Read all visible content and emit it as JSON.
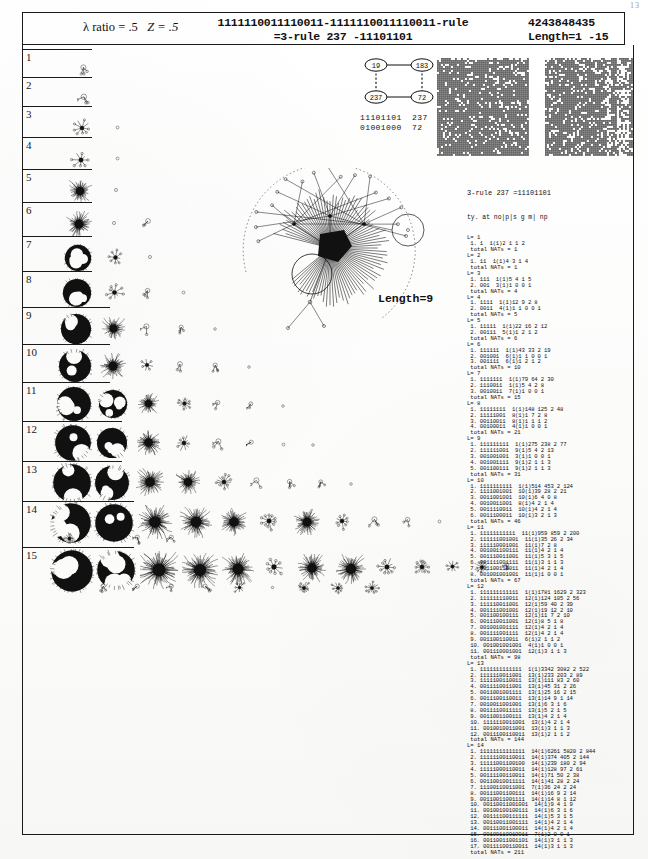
{
  "page": {
    "page_number": "13",
    "paper_tone": "#fbfbfa",
    "ink_color": "#111111"
  },
  "header": {
    "lambda_ratio_label": "λ ratio = .5",
    "z_label": "Z = .5",
    "rule_line_1": "1111110011110011-1111110011110011-rule",
    "rule_line_2": "=3-rule 237 -11101101",
    "rule_number": "4243848435",
    "length_range": "Length=1 -15"
  },
  "node_graph": {
    "nodes": [
      {
        "id": "n-top-left",
        "label": "19",
        "cx": 20,
        "cy": 10
      },
      {
        "id": "n-top-right",
        "label": "183",
        "cx": 66,
        "cy": 10
      },
      {
        "id": "n-bottom-left",
        "label": "237",
        "cx": 20,
        "cy": 42
      },
      {
        "id": "n-bottom-right",
        "label": "72",
        "cx": 66,
        "cy": 42
      }
    ],
    "edges": [
      {
        "from": "n-top-left",
        "to": "n-top-right",
        "style": "solid"
      },
      {
        "from": "n-bottom-left",
        "to": "n-bottom-right",
        "style": "solid"
      },
      {
        "from": "n-top-left",
        "to": "n-bottom-left",
        "style": "dashed"
      },
      {
        "from": "n-top-right",
        "to": "n-bottom-right",
        "style": "dashed"
      }
    ],
    "binary_rows": [
      {
        "bits": "11101101",
        "decimal": "237"
      },
      {
        "bits": "01001000",
        "decimal": "72"
      }
    ]
  },
  "space_time_diagrams": [
    {
      "name": "spacetime-left",
      "x": 437,
      "width": 92,
      "height": 98,
      "cols": 46,
      "rows": 49,
      "seed": 1734,
      "density": 0.86,
      "streak_cols": []
    },
    {
      "name": "spacetime-right",
      "x": 545,
      "width": 88,
      "height": 98,
      "cols": 44,
      "rows": 49,
      "seed": 9021,
      "density": 0.82,
      "streak_cols": [
        31,
        32,
        36,
        37,
        38,
        39,
        40,
        41
      ]
    }
  ],
  "big_basin": {
    "length_label": "Length=9",
    "attractor_cycle_nodes": 9,
    "fan_spokes": 86,
    "outer_tree_nodes": 17
  },
  "rows": [
    {
      "number": "1",
      "top": 49,
      "height": 28,
      "glyphs": [
        {
          "x": 55,
          "y": 12,
          "size": 16,
          "kind": "sprout"
        }
      ]
    },
    {
      "number": "2",
      "top": 77,
      "height": 29,
      "glyphs": [
        {
          "x": 55,
          "y": 13,
          "size": 17,
          "kind": "sprout"
        }
      ]
    },
    {
      "number": "3",
      "top": 106,
      "height": 31,
      "glyphs": [
        {
          "x": 50,
          "y": 12,
          "size": 20,
          "kind": "star"
        },
        {
          "x": 90,
          "y": 16,
          "size": 11,
          "kind": "dot"
        }
      ]
    },
    {
      "number": "4",
      "top": 137,
      "height": 32,
      "glyphs": [
        {
          "x": 48,
          "y": 12,
          "size": 22,
          "kind": "star"
        },
        {
          "x": 90,
          "y": 16,
          "size": 11,
          "kind": "dot"
        }
      ]
    },
    {
      "number": "5",
      "top": 169,
      "height": 33,
      "glyphs": [
        {
          "x": 46,
          "y": 10,
          "size": 24,
          "kind": "bush"
        },
        {
          "x": 88,
          "y": 15,
          "size": 12,
          "kind": "dot"
        }
      ]
    },
    {
      "number": "6",
      "top": 202,
      "height": 34,
      "glyphs": [
        {
          "x": 44,
          "y": 9,
          "size": 26,
          "kind": "bush"
        },
        {
          "x": 86,
          "y": 15,
          "size": 12,
          "kind": "dot"
        },
        {
          "x": 120,
          "y": 13,
          "size": 15,
          "kind": "sprout"
        }
      ]
    },
    {
      "number": "7",
      "top": 236,
      "height": 35,
      "glyphs": [
        {
          "x": 42,
          "y": 8,
          "size": 28,
          "kind": "blob"
        },
        {
          "x": 84,
          "y": 12,
          "size": 19,
          "kind": "star"
        },
        {
          "x": 122,
          "y": 15,
          "size": 12,
          "kind": "dot"
        }
      ]
    },
    {
      "number": "8",
      "top": 271,
      "height": 36,
      "glyphs": [
        {
          "x": 40,
          "y": 7,
          "size": 30,
          "kind": "blob"
        },
        {
          "x": 82,
          "y": 11,
          "size": 21,
          "kind": "star"
        },
        {
          "x": 120,
          "y": 14,
          "size": 14,
          "kind": "sprout"
        },
        {
          "x": 156,
          "y": 16,
          "size": 11,
          "kind": "dot"
        }
      ]
    },
    {
      "number": "9",
      "top": 307,
      "height": 37,
      "glyphs": [
        {
          "x": 38,
          "y": 6,
          "size": 32,
          "kind": "blob"
        },
        {
          "x": 80,
          "y": 10,
          "size": 23,
          "kind": "bush"
        },
        {
          "x": 118,
          "y": 13,
          "size": 16,
          "kind": "sprout"
        },
        {
          "x": 154,
          "y": 15,
          "size": 13,
          "kind": "sprout"
        },
        {
          "x": 188,
          "y": 17,
          "size": 10,
          "kind": "dot"
        }
      ]
    },
    {
      "number": "10",
      "top": 344,
      "height": 38,
      "glyphs": [
        {
          "x": 36,
          "y": 5,
          "size": 34,
          "kind": "blob"
        },
        {
          "x": 78,
          "y": 9,
          "size": 26,
          "kind": "bush"
        },
        {
          "x": 116,
          "y": 12,
          "size": 18,
          "kind": "star"
        },
        {
          "x": 152,
          "y": 14,
          "size": 15,
          "kind": "sprout"
        },
        {
          "x": 188,
          "y": 16,
          "size": 13,
          "kind": "sprout"
        },
        {
          "x": 222,
          "y": 18,
          "size": 10,
          "kind": "dot"
        }
      ]
    },
    {
      "number": "11",
      "top": 382,
      "height": 39,
      "glyphs": [
        {
          "x": 34,
          "y": 4,
          "size": 36,
          "kind": "blob"
        },
        {
          "x": 76,
          "y": 7,
          "size": 30,
          "kind": "blob"
        },
        {
          "x": 116,
          "y": 11,
          "size": 21,
          "kind": "bush"
        },
        {
          "x": 154,
          "y": 13,
          "size": 17,
          "kind": "star"
        },
        {
          "x": 190,
          "y": 15,
          "size": 14,
          "kind": "sprout"
        },
        {
          "x": 224,
          "y": 17,
          "size": 12,
          "kind": "sprout"
        },
        {
          "x": 256,
          "y": 19,
          "size": 10,
          "kind": "dot"
        }
      ]
    },
    {
      "number": "12",
      "top": 421,
      "height": 40,
      "glyphs": [
        {
          "x": 32,
          "y": 3,
          "size": 38,
          "kind": "blob"
        },
        {
          "x": 74,
          "y": 6,
          "size": 32,
          "kind": "blob"
        },
        {
          "x": 114,
          "y": 9,
          "size": 25,
          "kind": "bush"
        },
        {
          "x": 152,
          "y": 12,
          "size": 20,
          "kind": "star"
        },
        {
          "x": 190,
          "y": 14,
          "size": 16,
          "kind": "sprout"
        },
        {
          "x": 224,
          "y": 16,
          "size": 13,
          "kind": "sprout"
        },
        {
          "x": 256,
          "y": 18,
          "size": 11,
          "kind": "dot"
        },
        {
          "x": 286,
          "y": 19,
          "size": 10,
          "kind": "dot"
        }
      ]
    },
    {
      "number": "13",
      "top": 461,
      "height": 40,
      "glyphs": [
        {
          "x": 30,
          "y": 2,
          "size": 40,
          "kind": "blob"
        },
        {
          "x": 72,
          "y": 4,
          "size": 36,
          "kind": "blob"
        },
        {
          "x": 114,
          "y": 7,
          "size": 28,
          "kind": "bush"
        },
        {
          "x": 154,
          "y": 9,
          "size": 24,
          "kind": "bush"
        },
        {
          "x": 192,
          "y": 11,
          "size": 20,
          "kind": "star"
        },
        {
          "x": 228,
          "y": 13,
          "size": 16,
          "kind": "sprout"
        },
        {
          "x": 262,
          "y": 15,
          "size": 14,
          "kind": "sprout"
        },
        {
          "x": 294,
          "y": 16,
          "size": 12,
          "kind": "sprout"
        },
        {
          "x": 324,
          "y": 18,
          "size": 10,
          "kind": "dot"
        }
      ]
    },
    {
      "number": "14",
      "top": 501,
      "height": 46,
      "glyphs": [
        {
          "x": 28,
          "y": 1,
          "size": 42,
          "kind": "blob"
        },
        {
          "x": 72,
          "y": 2,
          "size": 40,
          "kind": "blob"
        },
        {
          "x": 116,
          "y": 4,
          "size": 34,
          "kind": "bush"
        },
        {
          "x": 158,
          "y": 5,
          "size": 32,
          "kind": "bush"
        },
        {
          "x": 198,
          "y": 7,
          "size": 28,
          "kind": "bush"
        },
        {
          "x": 236,
          "y": 9,
          "size": 22,
          "kind": "star"
        },
        {
          "x": 272,
          "y": 8,
          "size": 26,
          "kind": "bush"
        },
        {
          "x": 310,
          "y": 10,
          "size": 20,
          "kind": "star"
        },
        {
          "x": 346,
          "y": 12,
          "size": 16,
          "kind": "sprout"
        },
        {
          "x": 380,
          "y": 13,
          "size": 14,
          "kind": "sprout"
        },
        {
          "x": 412,
          "y": 15,
          "size": 11,
          "kind": "dot"
        },
        {
          "x": 40,
          "y": 30,
          "size": 15,
          "kind": "star"
        },
        {
          "x": 78,
          "y": 33,
          "size": 9,
          "kind": "dot"
        },
        {
          "x": 110,
          "y": 31,
          "size": 13,
          "kind": "sprout"
        },
        {
          "x": 144,
          "y": 31,
          "size": 13,
          "kind": "sprout"
        }
      ]
    },
    {
      "number": "15",
      "top": 547,
      "height": 60,
      "glyphs": [
        {
          "x": 28,
          "y": 2,
          "size": 44,
          "kind": "blob"
        },
        {
          "x": 74,
          "y": 3,
          "size": 40,
          "kind": "blob"
        },
        {
          "x": 118,
          "y": 4,
          "size": 38,
          "kind": "bush"
        },
        {
          "x": 160,
          "y": 5,
          "size": 36,
          "kind": "bush"
        },
        {
          "x": 200,
          "y": 6,
          "size": 32,
          "kind": "bush"
        },
        {
          "x": 240,
          "y": 8,
          "size": 24,
          "kind": "star"
        },
        {
          "x": 276,
          "y": 7,
          "size": 28,
          "kind": "bush"
        },
        {
          "x": 314,
          "y": 7,
          "size": 30,
          "kind": "bush"
        },
        {
          "x": 354,
          "y": 9,
          "size": 22,
          "kind": "star"
        },
        {
          "x": 390,
          "y": 10,
          "size": 20,
          "kind": "star"
        },
        {
          "x": 422,
          "y": 11,
          "size": 17,
          "kind": "star"
        },
        {
          "x": 452,
          "y": 12,
          "size": 16,
          "kind": "star"
        },
        {
          "x": 480,
          "y": 13,
          "size": 12,
          "kind": "sprout"
        },
        {
          "x": 44,
          "y": 36,
          "size": 9,
          "kind": "dot"
        },
        {
          "x": 76,
          "y": 34,
          "size": 13,
          "kind": "sprout"
        },
        {
          "x": 110,
          "y": 34,
          "size": 13,
          "kind": "sprout"
        },
        {
          "x": 144,
          "y": 34,
          "size": 13,
          "kind": "sprout"
        },
        {
          "x": 178,
          "y": 34,
          "size": 13,
          "kind": "sprout"
        },
        {
          "x": 210,
          "y": 33,
          "size": 15,
          "kind": "star"
        },
        {
          "x": 246,
          "y": 36,
          "size": 9,
          "kind": "dot"
        },
        {
          "x": 274,
          "y": 33,
          "size": 16,
          "kind": "star"
        },
        {
          "x": 308,
          "y": 33,
          "size": 16,
          "kind": "star"
        },
        {
          "x": 342,
          "y": 33,
          "size": 16,
          "kind": "star"
        }
      ]
    }
  ],
  "data_panel": {
    "title": "3-rule 237 =11101101",
    "column_header": "ty. at no|p|s g m| np",
    "blocks": [
      {
        "L": "L= 1",
        "lines": [
          "1. 1  1(1)2 1 1 2"
        ],
        "total": "total NATs = 1"
      },
      {
        "L": "L= 2",
        "lines": [
          "1. 11  1(1)4 3 1 4"
        ],
        "total": "total NATs = 1"
      },
      {
        "L": "L= 3",
        "lines": [
          "1. 111  1(1)5 4 1 5",
          "2. 001  3(1)1 0 0 1"
        ],
        "total": "total NATs = 4"
      },
      {
        "L": "L= 4",
        "lines": [
          "1. 1111  1(1)12 9 2 8",
          "2. 0011  4(1)1 1 0 0 1"
        ],
        "total": "total NATs = 5"
      },
      {
        "L": "L= 5",
        "lines": [
          "1. 11111  1(1)22 16 2 12",
          "2. 00111  5(1)1 2 1 2"
        ],
        "total": "total NATs = 6"
      },
      {
        "L": "L= 6",
        "lines": [
          "1. 111111  1(1)43 33 2 19",
          "2. 001001  6(1)1 1 0 0 1",
          "3. 001111  6(1)1 2 1 2"
        ],
        "total": "total NATs = 10"
      },
      {
        "L": "L= 7",
        "lines": [
          "1. 1111111  1(1)79 64 2 30",
          "2. 1110011  1(1)5 4 2 8",
          "3. 0010011  7(1)1 0 0 1"
        ],
        "total": "total NATs = 15"
      },
      {
        "L": "L= 8",
        "lines": [
          "1. 11111111  1(1)148 125 2 48",
          "2. 11111001  8(1)1 7 2 8",
          "3. 00110011  8(1)1 1 1 2",
          "4. 00100011  4(1)1 0 0 1"
        ],
        "total": "total NATs = 21"
      },
      {
        "L": "L= 9",
        "lines": [
          "1. 111111111  1(1)275 238 2 77",
          "2. 111111001  9(1)5 4 2 13",
          "3. 001001001  3(1)1 0 0 1",
          "4. 001001111  9(1)2 1 1 3",
          "5. 001100111  9(1)2 1 1 3"
        ],
        "total": "total NATs = 31"
      },
      {
        "L": "L= 10",
        "lines": [
          "1. 1111111111  1(1)514 453 2 124",
          "2. 1111001001  10(1)39 28 2 21",
          "3. 0011001001  10(1)6 4 0 8",
          "4. 0010011001  8(1)4 2 1 4",
          "5. 0011110011  10(1)4 2 1 4",
          "6. 0011100011  10(1)3 2 1 3"
        ],
        "total": "total NATs = 46"
      },
      {
        "L": "L= 11",
        "lines": [
          "1. 11111111111  11(1)959 859 2 200",
          "2. 111111001001  11(1)35 26 2 34",
          "3. 111110001001  11(1)7 2 8",
          "4. 001001100111  11(1)4 2 1 4",
          "5. 001110011001  11(1)5 3 1 5",
          "6. 001111001111  11(1)3 1 1 3",
          "7. 001100110011  11(1)4 2 1 4",
          "8. 001001001001  11(1)1 0 0 1"
        ],
        "total": "total NATs = 67"
      },
      {
        "L": "L= 12",
        "lines": [
          "1. 111111111111  1(1)1781 1629 2 323",
          "2. 111111110011  12(1)124 105 2 56",
          "3. 111110011001  12(1)59 40 2 39",
          "4. 001111001001  12(1)19 12 2 10",
          "5. 001100100111  12(1)11 7 2 10",
          "6. 001110011001  12(1)8 5 1 8",
          "7. 001001001111  12(1)4 2 1 4",
          "8. 001111001111  12(1)4 2 1 4",
          "9. 001100110011  6(1)2 1 1 2",
          "10. 001001001001  4(1)1 0 0 1",
          "11. 001110001001  12(1)3 1 1 3"
        ],
        "total": "total NATs = 98"
      },
      {
        "L": "L= 13",
        "lines": [
          "1. 1111111111111  1(1)3342 3082 2 522",
          "2. 1111110011001  13(1)233 203 2 89",
          "3. 1111100110011  13(1)111 83 2 60",
          "4. 0011110011001  13(1)45 31 2 26",
          "5. 0011001001111  13(1)25 16 2 15",
          "6. 0011100110011  13(1)14 9 1 14",
          "7. 0010011001001  13(1)6 3 1 6",
          "8. 0011110011111  13(1)5 2 1 5",
          "9. 0011001100111  13(1)4 2 1 4",
          "10. 1111110011001  13(1)4 2 1 4",
          "11. 0010010011001  13(1)3 1 1 3",
          "12. 0011100110011  13(1)2 1 1 2"
        ],
        "total": "total NATs = 144"
      },
      {
        "L": "L= 14",
        "lines": [
          "1. 11111111111111  14(1)6261 5820 2 844",
          "2. 11111100110011  14(1)374 405 2 144",
          "3. 11111001100100  14(1)239 180 2 94",
          "4. 11111000110011  14(1)128 97 2 61",
          "5. 00111100110011  14(1)71 50 2 38",
          "6. 00110010011111  14(1)41 28 2 24",
          "7. 11100110011001  7(1)36 24 2 24",
          "8. 00111001100111  14(1)16 9 2 14",
          "9. 00110011001111  14(1)14 8 1 12",
          "10. 00110011001001  14(1)9 4 1 9",
          "11. 00100100100111  14(1)6 3 1 6",
          "12. 00111100111111  14(1)5 3 1 5",
          "13. 00110011001111  14(1)4 2 1 4",
          "14. 00111001100011  14(1)4 2 1 4",
          "15. 00100110010011  7(1)2 0 0 1",
          "16. 00110011001101  14(1)3 1 1 3",
          "17. 00111100110011  14(1)3 1 1 3"
        ],
        "total": "total NATs = 211"
      }
    ]
  }
}
